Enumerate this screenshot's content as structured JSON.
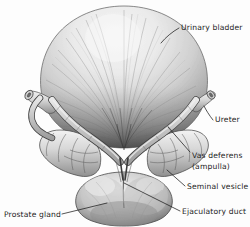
{
  "figure": {
    "background_color": "#fdfdfd",
    "ink_color": "#1c1c1c",
    "style": "grayscale pen-and-ink / airbrush anatomical illustration"
  },
  "labels": [
    {
      "id": "urinary-bladder",
      "text": "Urinary bladder",
      "line1": "Urinary bladder",
      "line2": "",
      "x": 181,
      "y": 30,
      "anchor": "start",
      "target_x": 162,
      "target_y": 42
    },
    {
      "id": "ureter",
      "text": "Ureter",
      "line1": "Ureter",
      "line2": "",
      "x": 215,
      "y": 122,
      "anchor": "start",
      "target_x": 205,
      "target_y": 106
    },
    {
      "id": "vas-deferens",
      "text": "Vas deferens (ampulla)",
      "line1": "Vas deferens",
      "line2": "(ampulla)",
      "x": 192,
      "y": 158,
      "anchor": "start",
      "target_x": 169,
      "target_y": 128
    },
    {
      "id": "seminal-vesicle",
      "text": "Seminal vesicle",
      "line1": "Seminal vesicle",
      "line2": "",
      "x": 187,
      "y": 189,
      "anchor": "start",
      "target_x": 168,
      "target_y": 170
    },
    {
      "id": "ejaculatory-duct",
      "text": "Ejaculatory duct",
      "line1": "Ejaculatory duct",
      "line2": "",
      "x": 182,
      "y": 214,
      "anchor": "start",
      "target_x": 124,
      "target_y": 183
    },
    {
      "id": "prostate-gland",
      "text": "Prostate gland",
      "line1": "Prostate gland",
      "line2": "",
      "x": 4,
      "y": 217,
      "anchor": "start",
      "target_x": 107,
      "target_y": 203
    }
  ],
  "structures": [
    {
      "id": "urinary-bladder",
      "name": "Urinary bladder",
      "description": "large domed organ with radiating detrusor muscle striations"
    },
    {
      "id": "ureter-left",
      "name": "Left ureter",
      "description": "cut tubular stub entering at upper left"
    },
    {
      "id": "ureter-right",
      "name": "Right ureter",
      "description": "cut tubular stub entering at upper right"
    },
    {
      "id": "vas-deferens-left",
      "name": "Left vas deferens (ampulla)",
      "description": "coiled tube crossing the bladder base"
    },
    {
      "id": "vas-deferens-right",
      "name": "Right vas deferens (ampulla)",
      "description": "coiled tube crossing the bladder base"
    },
    {
      "id": "seminal-vesicle-left",
      "name": "Left seminal vesicle",
      "description": "lobulated convoluted sac"
    },
    {
      "id": "seminal-vesicle-right",
      "name": "Right seminal vesicle",
      "description": "lobulated convoluted sac"
    },
    {
      "id": "prostate-gland",
      "name": "Prostate gland",
      "description": "rounded bilobed mass with midline groove at base"
    },
    {
      "id": "ejaculatory-duct",
      "name": "Ejaculatory duct",
      "description": "short duct entering the prostate at the midline"
    }
  ]
}
